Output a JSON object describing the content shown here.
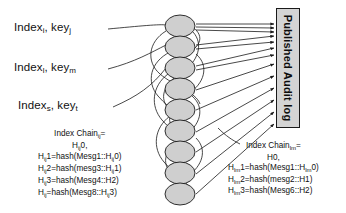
{
  "diagram": {
    "source_labels": [
      {
        "name": "index-key-1",
        "prefix": "Index",
        "sub1": "i",
        "mid": ", key",
        "sub2": "j"
      },
      {
        "name": "index-key-2",
        "prefix": "Index",
        "sub1": "l",
        "mid": ", key",
        "sub2": "m"
      },
      {
        "name": "index-key-3",
        "prefix": "Index",
        "sub1": "s",
        "mid": ", key",
        "sub2": "t"
      }
    ],
    "audit_log": {
      "label": "Published Audit log",
      "fill_color": "#d4d4d4",
      "border_color": "#1a1a1a"
    },
    "chain_left": {
      "heading_text": "Index Chain",
      "heading_sub": "ij",
      "heading_suffix": "=",
      "line0_main": "H",
      "line0_sub": "ij",
      "line0_suffix": "0,",
      "lines": [
        {
          "lhs_main": "H",
          "lhs_sub": "ij",
          "lhs_suffix": "1=hash(Mesg1::H",
          "tail_sub": "ij",
          "tail_suffix": "0)"
        },
        {
          "lhs_main": "H",
          "lhs_sub": "ij",
          "lhs_suffix": "2=hash(mesg3::H",
          "tail_sub": "ij",
          "tail_suffix": "1)"
        },
        {
          "lhs_main": "H",
          "lhs_sub": "ij",
          "lhs_suffix": "3=hash(Mesg4::H2)",
          "tail_sub": "",
          "tail_suffix": ""
        },
        {
          "lhs_main": "H",
          "lhs_sub": "ij",
          "lhs_suffix": "=hash(Mesg8::H",
          "tail_sub": "ij",
          "tail_suffix": "3)"
        }
      ]
    },
    "chain_right": {
      "heading_text": "Index Chain",
      "heading_sub": "lm",
      "heading_suffix": "=",
      "line0_main": "H0,",
      "line0_sub": "",
      "line0_suffix": "",
      "lines": [
        {
          "lhs_main": "H",
          "lhs_sub": "lm",
          "lhs_suffix": "1=hash(Mesg1::H",
          "tail_sub": "lm",
          "tail_suffix": "0)"
        },
        {
          "lhs_main": "H",
          "lhs_sub": "lm",
          "lhs_suffix": "2=hash(mesg2::H1)",
          "tail_sub": "",
          "tail_suffix": ""
        },
        {
          "lhs_main": "H",
          "lhs_sub": "lm",
          "lhs_suffix": "3=hash(Mesg6::H2)",
          "tail_sub": "",
          "tail_suffix": ""
        }
      ]
    },
    "nodes": {
      "count": 9,
      "fill_color": "#cfcfcf",
      "stroke_color": "#1a1a1a",
      "rx": 15,
      "ry": 11,
      "cx": 180,
      "cy_list": [
        26,
        47,
        68,
        89,
        110,
        131,
        152,
        173,
        194
      ]
    },
    "stroke_color": "#1a1a1a"
  }
}
